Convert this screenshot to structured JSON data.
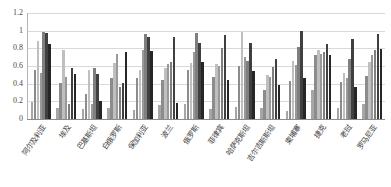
{
  "chart_data": {
    "type": "bar",
    "title": "",
    "xlabel": "",
    "ylabel": "",
    "ylim": [
      0,
      1.2
    ],
    "grid": true,
    "legend_position": "none",
    "y_ticks": [
      "0",
      "0.2",
      "0.4",
      "0.6",
      "0.8",
      "1",
      "1.2"
    ],
    "y_tick_values": [
      0,
      0.2,
      0.4,
      0.6,
      0.8,
      1,
      1.2
    ],
    "categories": [
      "阿尔及利亚",
      "埃及",
      "巴基斯坦",
      "白俄罗斯",
      "保加利亚",
      "波兰",
      "俄罗斯",
      "菲律宾",
      "哈萨克斯坦",
      "吉尔吉斯斯坦",
      "柬埔寨",
      "捷克",
      "老挝",
      "罗马尼亚"
    ],
    "series": [
      {
        "name": "系列1",
        "color": "#a6a6a6",
        "values": [
          0.19,
          0.12,
          0.11,
          0.13,
          0.1,
          0.16,
          0.17,
          0.11,
          0.14,
          0.13,
          0.09,
          0.33,
          0.12,
          0.17
        ]
      },
      {
        "name": "系列2",
        "color": "#8c8c8c",
        "values": [
          0.55,
          0.41,
          0.28,
          0.46,
          0.46,
          0.44,
          0.55,
          0.47,
          0.6,
          0.33,
          0.43,
          0.72,
          0.42,
          0.49
        ]
      },
      {
        "name": "系列3",
        "color": "#bfbfbf",
        "values": [
          0.88,
          0.78,
          0.55,
          0.63,
          0.55,
          0.58,
          0.63,
          0.62,
          0.99,
          0.5,
          0.66,
          0.78,
          0.52,
          0.64
        ]
      },
      {
        "name": "系列4",
        "color": "#999999",
        "values": [
          0.52,
          0.48,
          0.17,
          0.74,
          0.78,
          0.62,
          0.76,
          0.6,
          0.7,
          0.48,
          0.61,
          0.74,
          0.46,
          0.73
        ]
      },
      {
        "name": "系列5",
        "color": "#7f7f7f",
        "values": [
          0.99,
          0.17,
          0.58,
          0.36,
          0.96,
          0.64,
          0.97,
          0.8,
          0.66,
          0.59,
          0.81,
          0.76,
          0.68,
          0.78
        ]
      },
      {
        "name": "系列6",
        "color": "#404040",
        "values": [
          0.97,
          0.58,
          0.51,
          0.41,
          0.93,
          0.93,
          0.86,
          0.95,
          0.86,
          0.68,
          1.0,
          0.85,
          0.91,
          0.96
        ]
      },
      {
        "name": "系列7",
        "color": "#262626",
        "values": [
          0.85,
          0.51,
          0.2,
          0.76,
          0.77,
          0.18,
          0.64,
          0.44,
          0.54,
          0.38,
          0.46,
          0.72,
          0.36,
          0.79
        ]
      }
    ]
  }
}
